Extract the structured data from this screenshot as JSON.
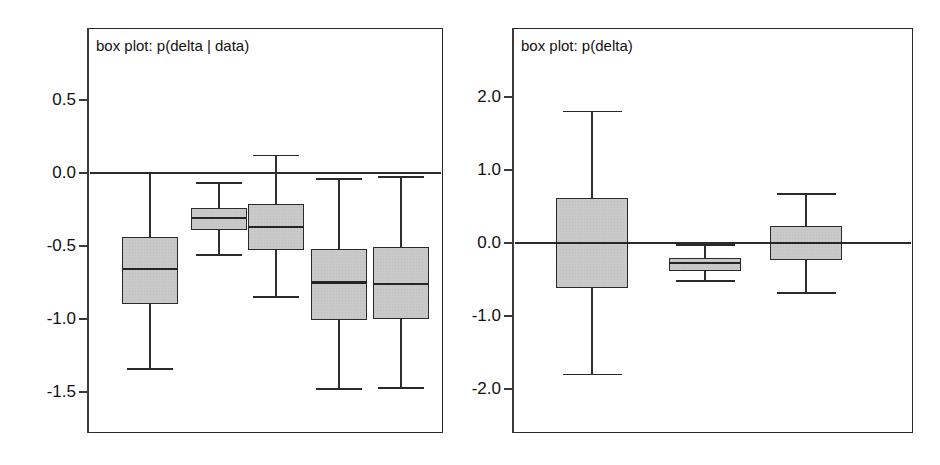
{
  "figure": {
    "background": "#ffffff",
    "box_fill": "#c9c9c9",
    "line_color": "#2a2a2a"
  },
  "chart_data": [
    {
      "type": "box",
      "panel_id": "left",
      "title": "box plot: p(delta | data)",
      "xlabel": "",
      "ylabel": "",
      "ylim": [
        -1.78,
        0.85
      ],
      "yticks": [
        0.5,
        0.0,
        -0.5,
        -1.0,
        -1.5
      ],
      "ytick_labels": [
        "0.5",
        "0.0",
        "-0.5",
        "-1.0",
        "-1.5"
      ],
      "grid": false,
      "legend": "none",
      "reference_line": 0.0,
      "categories": [
        "1",
        "2",
        "3",
        "4",
        "5"
      ],
      "boxes": [
        {
          "name": "1",
          "whisker_low": -1.34,
          "q1": -0.9,
          "median": -0.66,
          "q3": -0.44,
          "whisker_high": 0.0
        },
        {
          "name": "2",
          "whisker_low": -0.56,
          "q1": -0.39,
          "median": -0.31,
          "q3": -0.24,
          "whisker_high": -0.07
        },
        {
          "name": "3",
          "whisker_low": -0.85,
          "q1": -0.53,
          "median": -0.37,
          "q3": -0.21,
          "whisker_high": 0.12
        },
        {
          "name": "4",
          "whisker_low": -1.48,
          "q1": -1.01,
          "median": -0.75,
          "q3": -0.52,
          "whisker_high": -0.04
        },
        {
          "name": "5",
          "whisker_low": -1.47,
          "q1": -1.0,
          "median": -0.76,
          "q3": -0.51,
          "whisker_high": -0.03
        }
      ]
    },
    {
      "type": "box",
      "panel_id": "right",
      "title": "box plot: p(delta)",
      "xlabel": "",
      "ylabel": "",
      "ylim": [
        -2.46,
        2.52
      ],
      "yticks": [
        2.0,
        1.0,
        0.0,
        -1.0,
        -2.0
      ],
      "ytick_labels": [
        "2.0",
        "1.0",
        "0.0",
        "-1.0",
        "-2.0"
      ],
      "grid": false,
      "legend": "none",
      "reference_line": 0.0,
      "categories": [
        "1",
        "2",
        "3"
      ],
      "boxes": [
        {
          "name": "1",
          "whisker_low": -1.8,
          "q1": -0.62,
          "median": 0.0,
          "q3": 0.62,
          "whisker_high": 1.8
        },
        {
          "name": "2",
          "whisker_low": -0.52,
          "q1": -0.38,
          "median": -0.27,
          "q3": -0.21,
          "whisker_high": -0.03
        },
        {
          "name": "3",
          "whisker_low": -0.69,
          "q1": -0.23,
          "median": 0.0,
          "q3": 0.23,
          "whisker_high": 0.67
        }
      ]
    }
  ]
}
